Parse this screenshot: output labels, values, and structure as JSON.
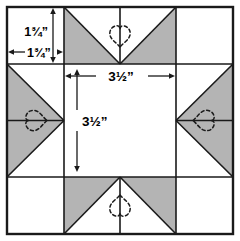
{
  "diagram": {
    "type": "quilt-block-pattern",
    "name": "Sawtooth Star Block",
    "colors": {
      "fabric_shaded": "#b4b4b4",
      "fabric_plain": "#ffffff",
      "outline": "#1a1a1a",
      "quilting_line": "#1a1a1a",
      "background": "#ffffff"
    },
    "grid": {
      "columns": 3,
      "rows": 3,
      "block_left": 7,
      "block_top": 7,
      "block_size": 226,
      "corner_size": 57,
      "center_size": 112
    },
    "dimensions": [
      {
        "id": "corner-height",
        "label": "1¾”",
        "orientation": "vertical",
        "measures": "corner-square-height"
      },
      {
        "id": "corner-width",
        "label": "1¾”",
        "orientation": "horizontal",
        "measures": "corner-square-width"
      },
      {
        "id": "center-width",
        "label": "3½”",
        "orientation": "horizontal",
        "measures": "center-square-width"
      },
      {
        "id": "center-height",
        "label": "3½”",
        "orientation": "vertical",
        "measures": "center-square-height"
      }
    ],
    "patches": [
      {
        "id": "corner-top-left",
        "shape": "square",
        "fill": "plain"
      },
      {
        "id": "corner-top-right",
        "shape": "square",
        "fill": "plain"
      },
      {
        "id": "corner-bottom-left",
        "shape": "square",
        "fill": "plain"
      },
      {
        "id": "corner-bottom-right",
        "shape": "square",
        "fill": "plain"
      },
      {
        "id": "star-point-top",
        "shape": "flying-geese",
        "fill": "shaded"
      },
      {
        "id": "star-point-left",
        "shape": "flying-geese",
        "fill": "shaded"
      },
      {
        "id": "star-point-right",
        "shape": "flying-geese",
        "fill": "shaded"
      },
      {
        "id": "star-point-bottom",
        "shape": "flying-geese",
        "fill": "shaded"
      },
      {
        "id": "center-square",
        "shape": "square",
        "fill": "plain"
      }
    ],
    "quilting_motifs": [
      {
        "id": "heart-top",
        "shape": "heart",
        "style": "dashed",
        "rotation": 180
      },
      {
        "id": "heart-left",
        "shape": "heart",
        "style": "dashed",
        "rotation": 270
      },
      {
        "id": "heart-right",
        "shape": "heart",
        "style": "dashed",
        "rotation": 90
      },
      {
        "id": "heart-bottom",
        "shape": "heart",
        "style": "dashed",
        "rotation": 0
      }
    ]
  }
}
